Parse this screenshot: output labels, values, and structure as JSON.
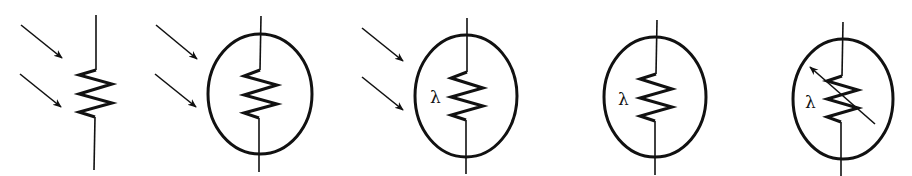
{
  "diagram": {
    "stroke_color": "#111111",
    "background": "#ffffff",
    "symbols": [
      {
        "id": "ldr-arrows-no-circle",
        "has_circle": false,
        "incoming_light_arrows": 2,
        "lambda_label": "",
        "variable_arrow": false
      },
      {
        "id": "ldr-arrows-circle",
        "has_circle": true,
        "incoming_light_arrows": 2,
        "lambda_label": "",
        "variable_arrow": false
      },
      {
        "id": "ldr-arrows-circle-lambda",
        "has_circle": true,
        "incoming_light_arrows": 2,
        "lambda_label": "λ",
        "variable_arrow": false
      },
      {
        "id": "ldr-circle-lambda",
        "has_circle": true,
        "incoming_light_arrows": 0,
        "lambda_label": "λ",
        "variable_arrow": false
      },
      {
        "id": "ldr-circle-lambda-variable",
        "has_circle": true,
        "incoming_light_arrows": 0,
        "lambda_label": "λ",
        "variable_arrow": true
      }
    ]
  }
}
